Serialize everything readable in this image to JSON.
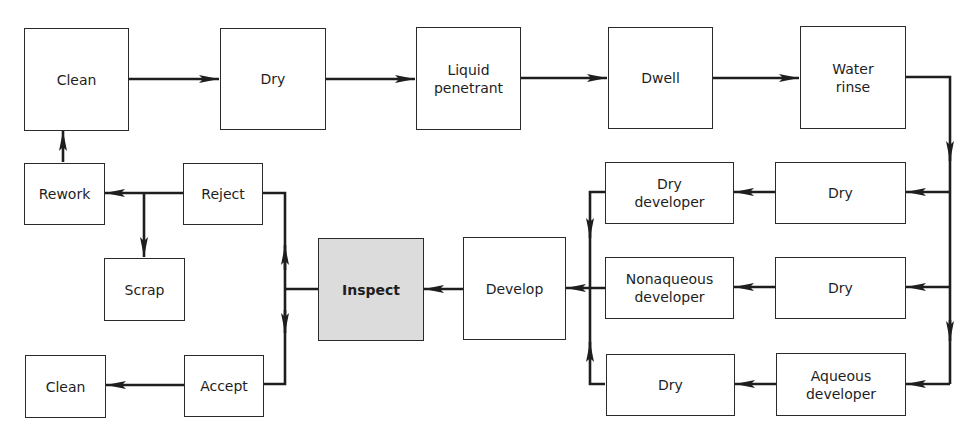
{
  "diagram": {
    "type": "process-flowchart",
    "colors": {
      "line": "#1e1e1e",
      "box_border": "#2a2a2a",
      "highlight_fill": "#dcdcdc",
      "background": "#ffffff"
    },
    "nodes": {
      "clean_start": "Clean",
      "dry_1": "Dry",
      "liquid_penetrant": "Liquid\npenetrant",
      "dwell": "Dwell",
      "water_rinse": "Water\nrinse",
      "dry_a": "Dry",
      "dry_developer": "Dry\ndeveloper",
      "dry_b": "Dry",
      "nonaqueous_developer": "Nonaqueous\ndeveloper",
      "aqueous_developer": "Aqueous\ndeveloper",
      "dry_c": "Dry",
      "develop": "Develop",
      "inspect": "Inspect",
      "reject": "Reject",
      "accept": "Accept",
      "rework": "Rework",
      "scrap": "Scrap",
      "clean_end": "Clean"
    },
    "edges": [
      [
        "clean_start",
        "dry_1"
      ],
      [
        "dry_1",
        "liquid_penetrant"
      ],
      [
        "liquid_penetrant",
        "dwell"
      ],
      [
        "dwell",
        "water_rinse"
      ],
      [
        "water_rinse",
        "dry_a"
      ],
      [
        "water_rinse",
        "dry_b"
      ],
      [
        "water_rinse",
        "aqueous_developer"
      ],
      [
        "dry_a",
        "dry_developer"
      ],
      [
        "dry_b",
        "nonaqueous_developer"
      ],
      [
        "aqueous_developer",
        "dry_c"
      ],
      [
        "dry_developer",
        "develop"
      ],
      [
        "nonaqueous_developer",
        "develop"
      ],
      [
        "dry_c",
        "develop"
      ],
      [
        "develop",
        "inspect"
      ],
      [
        "inspect",
        "reject"
      ],
      [
        "inspect",
        "accept"
      ],
      [
        "reject",
        "rework"
      ],
      [
        "reject",
        "scrap"
      ],
      [
        "rework",
        "clean_start"
      ],
      [
        "accept",
        "clean_end"
      ]
    ]
  }
}
